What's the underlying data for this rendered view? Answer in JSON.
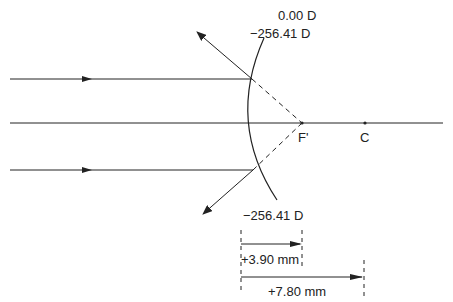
{
  "diagram": {
    "type": "convex-mirror-ray-diagram",
    "labels": {
      "top_power_1": "0.00 D",
      "top_power_2": "−256.41 D",
      "bottom_power": "−256.41 D",
      "focal_point": "F'",
      "center": "C",
      "dim_focal": "+3.90 mm",
      "dim_radius": "+7.80 mm"
    },
    "colors": {
      "stroke": "#222222",
      "background": "#ffffff"
    }
  }
}
